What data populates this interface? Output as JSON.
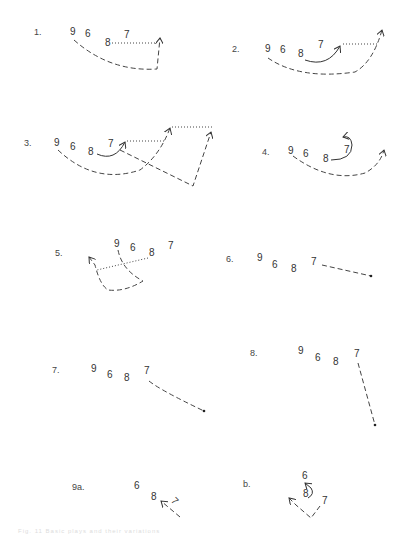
{
  "figure": {
    "caption": "Fig. 11 Basic plays and their variations",
    "diagrams": [
      {
        "label": "1.",
        "players": [
          "9",
          "6",
          "8",
          "7"
        ]
      },
      {
        "label": "2.",
        "players": [
          "9",
          "6",
          "8",
          "7"
        ]
      },
      {
        "label": "3.",
        "players": [
          "9",
          "6",
          "8",
          "7"
        ]
      },
      {
        "label": "4.",
        "players": [
          "9",
          "6",
          "8",
          "7"
        ]
      },
      {
        "label": "5.",
        "players": [
          "9",
          "6",
          "8",
          "7"
        ]
      },
      {
        "label": "6.",
        "players": [
          "9",
          "6",
          "8",
          "7"
        ]
      },
      {
        "label": "7.",
        "players": [
          "9",
          "6",
          "8",
          "7"
        ]
      },
      {
        "label": "8.",
        "players": [
          "9",
          "6",
          "8",
          "7"
        ]
      },
      {
        "label": "9a.",
        "players": [
          "6",
          "8",
          "7"
        ]
      },
      {
        "label": "b.",
        "players": [
          "6",
          "8",
          "7"
        ]
      }
    ]
  },
  "legend": {
    "dashed": "player run",
    "dotted": "pass",
    "solid": "player movement"
  }
}
